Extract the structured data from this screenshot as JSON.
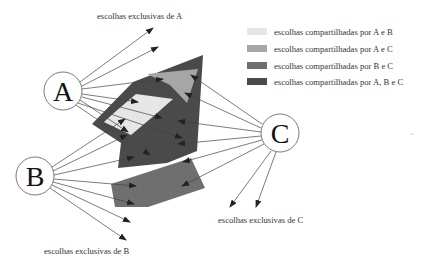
{
  "labels": {
    "exclusive_a": "escolhas exclusivas de A",
    "exclusive_b": "escolhas exclusivas de B",
    "exclusive_c": "escolhas exclusivas de C"
  },
  "nodes": [
    {
      "id": "A",
      "label": "A"
    },
    {
      "id": "B",
      "label": "B"
    },
    {
      "id": "C",
      "label": "C"
    }
  ],
  "legend": [
    {
      "label": "escolhas compartilhadas por A e B",
      "color": "#e6e6e6"
    },
    {
      "label": "escolhas compartilhadas por A e C",
      "color": "#a6a6a6"
    },
    {
      "label": "escolhas compartilhadas por B e C",
      "color": "#6f6f6f"
    },
    {
      "label": "escolhas compartilhadas por A, B e C",
      "color": "#4a4a4a"
    }
  ],
  "colors": {
    "ab": "#e6e6e6",
    "ac": "#a6a6a6",
    "bc": "#6f6f6f",
    "abc": "#4a4a4a",
    "line": "#444444"
  }
}
